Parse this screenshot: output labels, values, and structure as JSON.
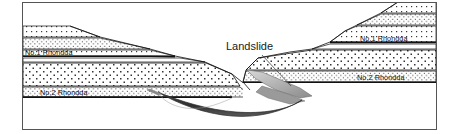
{
  "figure": {
    "frame": {
      "x": 22,
      "y": 2,
      "width": 415,
      "height": 128,
      "stroke": "#555555"
    },
    "background": "#ffffff"
  },
  "colors": {
    "outline": "#111111",
    "frame_stroke": "#555555",
    "seam_band": "#1a1a1a",
    "stipple_dot": "#333333",
    "landslide_dark": "#3a3a3a",
    "landslide_light": "#b8b8b8",
    "landslide_mid": "#8d8d8d",
    "leader_line": "#555555",
    "rock_fill": "#ffffff"
  },
  "labels": {
    "landslide": {
      "text": "Landslide",
      "x": 226,
      "y": 50,
      "leader": {
        "x1": 262,
        "y1": 55,
        "x2": 291,
        "y2": 86
      }
    },
    "strata": [
      {
        "id": "left-no1-rhondda",
        "text": "No.1 Rhondda",
        "x": 25,
        "y": 52,
        "side": "left",
        "seam": 1
      },
      {
        "id": "left-no2-rhondda",
        "text": "No.2 Rhondda",
        "x": 40,
        "y": 92,
        "side": "left",
        "seam": 2
      },
      {
        "id": "right-no1-rhondda",
        "text": "No.1 Rhondda",
        "x": 360,
        "y": 38,
        "side": "right",
        "seam": 1
      },
      {
        "id": "right-no2-rhondda",
        "text": "No.2 Rhondda",
        "x": 357,
        "y": 74,
        "side": "right",
        "seam": 2
      }
    ]
  },
  "geology": {
    "description": "Symmetrical valley section: left hillside descends left-to-right, right hillside rises to the right. Coal seams No.1 Rhondda and No.2 Rhondda are traced as dark bands across both flanks. A landslide mass occupies the valley floor and lower right slope.",
    "seams": [
      "No.1 Rhondda",
      "No.2 Rhondda"
    ],
    "units": [
      {
        "id": "left-cap",
        "side": "left",
        "fill": "stipple-coarse"
      },
      {
        "id": "left-upper-sandstone",
        "side": "left",
        "fill": "stipple-fine"
      },
      {
        "id": "left-no1-seam",
        "side": "left",
        "fill": "seam"
      },
      {
        "id": "left-mid-mudstone",
        "side": "left",
        "fill": "stipple-fine"
      },
      {
        "id": "left-main-sandstone",
        "side": "left",
        "fill": "stipple-coarse"
      },
      {
        "id": "left-no2-seam",
        "side": "left",
        "fill": "seam"
      },
      {
        "id": "left-lower-beds",
        "side": "left",
        "fill": "plain"
      },
      {
        "id": "right-cap",
        "side": "right",
        "fill": "stipple-coarse"
      },
      {
        "id": "right-upper-sandstone",
        "side": "right",
        "fill": "stipple-fine"
      },
      {
        "id": "right-no1-seam",
        "side": "right",
        "fill": "seam"
      },
      {
        "id": "right-mid-mudstone",
        "side": "right",
        "fill": "stipple-fine"
      },
      {
        "id": "right-main-sandstone",
        "side": "right",
        "fill": "stipple-coarse"
      },
      {
        "id": "right-no2-seam",
        "side": "right",
        "fill": "seam"
      },
      {
        "id": "right-lower-beds",
        "side": "right",
        "fill": "plain"
      }
    ],
    "landslide": {
      "id": "landslide-mass",
      "parts": [
        "valley-floor-dark-lens",
        "upper-scarp-light-wedge",
        "mid-tongue"
      ]
    }
  }
}
